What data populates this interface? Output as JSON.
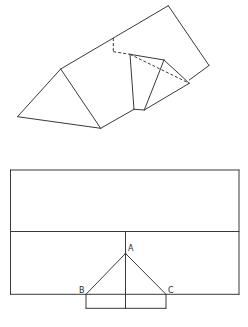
{
  "colors": {
    "line": "#3a3a3a",
    "background": "#ffffff",
    "label": "#2a2a2a"
  },
  "figure_top": {
    "name": "folded-triangular-prism",
    "solid_segments": [
      [
        17.5,
        116.7,
        60.7,
        69.0
      ],
      [
        60.7,
        69.0,
        100.7,
        128.3
      ],
      [
        17.5,
        116.7,
        100.7,
        128.3
      ],
      [
        60.7,
        69.0,
        168.3,
        5.7
      ],
      [
        168.3,
        5.7,
        209.0,
        65.5
      ],
      [
        209.0,
        65.5,
        189.3,
        80.0
      ],
      [
        100.7,
        128.3,
        134.0,
        109.3
      ],
      [
        134.0,
        109.3,
        144.3,
        110.0
      ],
      [
        144.3,
        110.0,
        189.3,
        83.3
      ],
      [
        130.0,
        54.3,
        134.0,
        109.3
      ],
      [
        130.0,
        54.3,
        164.0,
        60.0
      ],
      [
        164.0,
        60.0,
        144.3,
        110.0
      ],
      [
        164.0,
        60.0,
        189.3,
        83.3
      ]
    ],
    "dashed_segments": [
      [
        113.3,
        38.1,
        113.3,
        51.7
      ],
      [
        113.3,
        51.7,
        130.0,
        54.3
      ],
      [
        130.0,
        54.3,
        189.3,
        83.3
      ]
    ]
  },
  "figure_bottom": {
    "name": "unfolded-net",
    "solid_segments": [
      [
        10.5,
        170.0,
        239.0,
        170.0
      ],
      [
        239.0,
        170.0,
        239.0,
        294.3
      ],
      [
        10.5,
        294.3,
        239.0,
        294.3
      ],
      [
        10.5,
        170.0,
        10.5,
        294.3
      ],
      [
        10.5,
        231.5,
        239.0,
        231.5
      ],
      [
        125.5,
        231.5,
        125.5,
        308.3
      ],
      [
        125.5,
        253.5,
        86.0,
        294.3
      ],
      [
        125.5,
        253.5,
        166.0,
        294.3
      ],
      [
        86.0,
        294.3,
        86.0,
        308.3
      ],
      [
        166.0,
        294.3,
        166.0,
        308.3
      ],
      [
        86.0,
        308.3,
        166.0,
        308.3
      ]
    ],
    "points": {
      "A": {
        "label": "A",
        "x": 125.5,
        "y": 253.5
      },
      "B": {
        "label": "B",
        "x": 86.0,
        "y": 294.3
      },
      "C": {
        "label": "C",
        "x": 166.0,
        "y": 294.3
      }
    }
  }
}
